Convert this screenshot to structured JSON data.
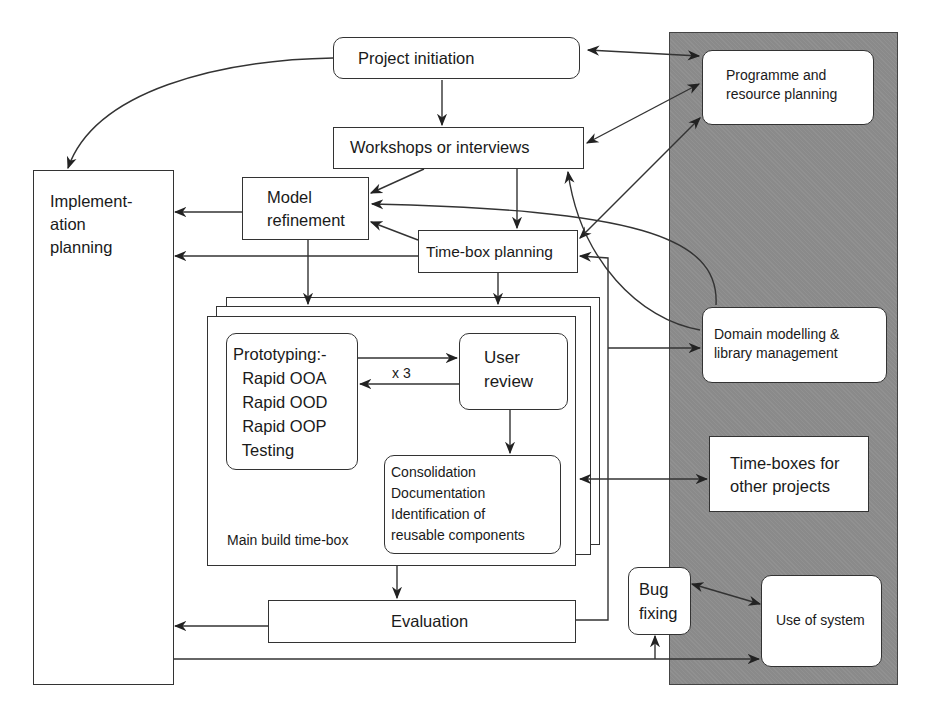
{
  "diagram": {
    "panel": {
      "color": "#8a8a8a"
    },
    "nodes": {
      "project_initiation": "Project initiation",
      "programme_planning": "Programme and\nresource planning",
      "workshops": "Workshops or interviews",
      "implementation_planning": "Implement-\nation\nplanning",
      "model_refinement": "Model\nrefinement",
      "timebox_planning": "Time-box planning",
      "prototyping": "Prototyping:-\n  Rapid OOA\n  Rapid OOD\n  Rapid OOP\n  Testing",
      "user_review": "User\nreview",
      "consolidation": "Consolidation\nDocumentation\nIdentification of\nreusable components",
      "main_build_timebox": "Main build time-box",
      "iteration_label": "x 3",
      "domain_modelling": "Domain modelling &\nlibrary management",
      "other_timeboxes": "Time-boxes for\nother projects",
      "bug_fixing": "Bug\nfixing",
      "use_of_system": "Use of system",
      "evaluation": "Evaluation"
    }
  }
}
